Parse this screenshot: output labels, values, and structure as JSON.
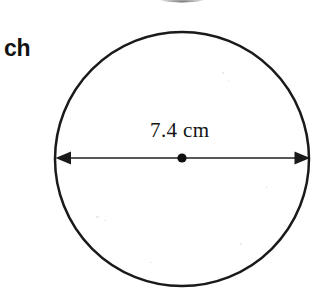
{
  "page": {
    "width": 314,
    "height": 300,
    "background_color": "#ffffff",
    "ink_color": "#1a1a1a"
  },
  "margin_text": {
    "text": "ch",
    "note": "cropped bold text fragment at left edge"
  },
  "figure": {
    "shape": "circle",
    "center": {
      "x": 182,
      "y": 159
    },
    "radius": 127,
    "stroke_color": "#1a1a1a",
    "stroke_width": 2.5,
    "fill": "none"
  },
  "dimension": {
    "label": "7.4 cm",
    "measures": "diameter",
    "value": 7.4,
    "unit": "cm",
    "line": {
      "y": 158,
      "x_start": 55,
      "x_end": 310,
      "stroke_width": 1.6,
      "arrowheads": "both"
    },
    "center_dot": {
      "x": 182,
      "y": 158,
      "radius": 4.5,
      "color": "#101010"
    }
  },
  "top_artifact": {
    "description": "faint clipped arc from element above crop",
    "x_start": 157,
    "x_end": 207,
    "color": "#6e6e6e"
  }
}
